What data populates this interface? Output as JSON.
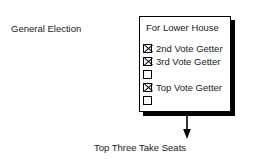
{
  "diagram": {
    "side_label": "General Election",
    "bottom_caption": "Top Three Take Seats",
    "arrow_icon": "down-arrow-icon",
    "ballot": {
      "title": "For Lower House",
      "options": [
        {
          "label": "2nd Vote Getter",
          "checked": true
        },
        {
          "label": "3rd Vote Getter",
          "checked": true
        },
        {
          "label": "",
          "checked": false
        },
        {
          "label": "Top Vote Getter",
          "checked": true
        },
        {
          "label": "",
          "checked": false
        }
      ]
    },
    "colors": {
      "ink": "#000000",
      "paper": "#ffffff"
    }
  }
}
